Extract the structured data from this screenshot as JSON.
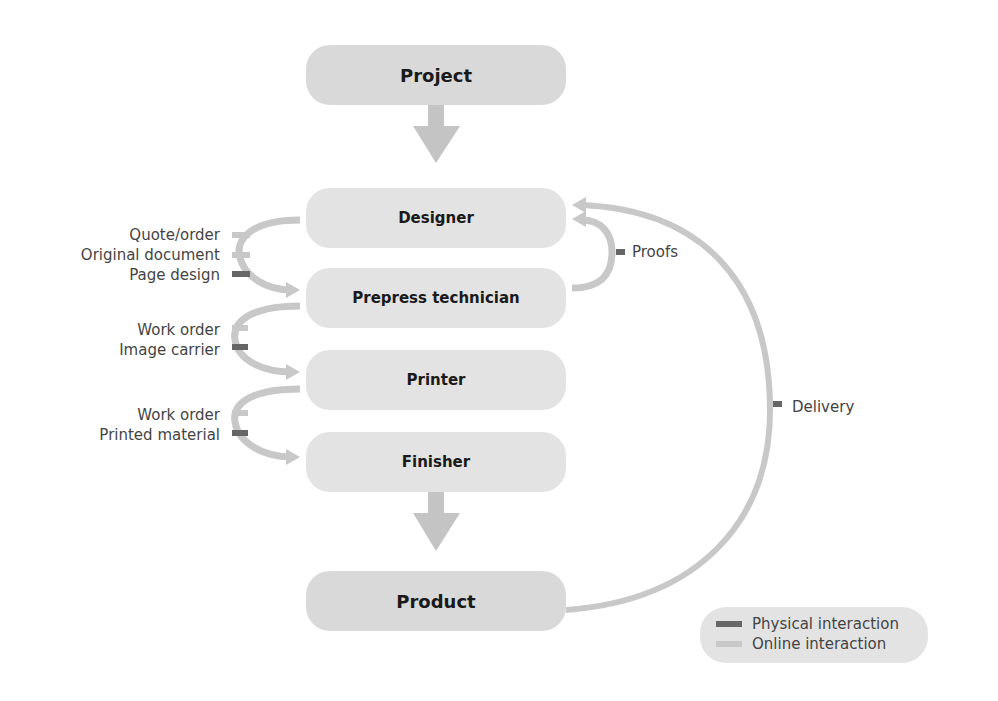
{
  "nodes": {
    "project": "Project",
    "designer": "Designer",
    "prepress": "Prepress technician",
    "printer": "Printer",
    "finisher": "Finisher",
    "product": "Product"
  },
  "flows": {
    "designer_to_prepress": [
      "Quote/order",
      "Original document",
      "Page design"
    ],
    "prepress_to_printer": [
      "Work order",
      "Image carrier"
    ],
    "printer_to_finisher": [
      "Work order",
      "Printed material"
    ],
    "proofs": "Proofs",
    "delivery": "Delivery"
  },
  "legend": {
    "physical": "Physical interaction",
    "online": "Online interaction"
  },
  "colors": {
    "node_fill": "#e3e3e3",
    "online": "#c8c8c8",
    "physical": "#666666",
    "arrow": "#c4c4c4"
  }
}
